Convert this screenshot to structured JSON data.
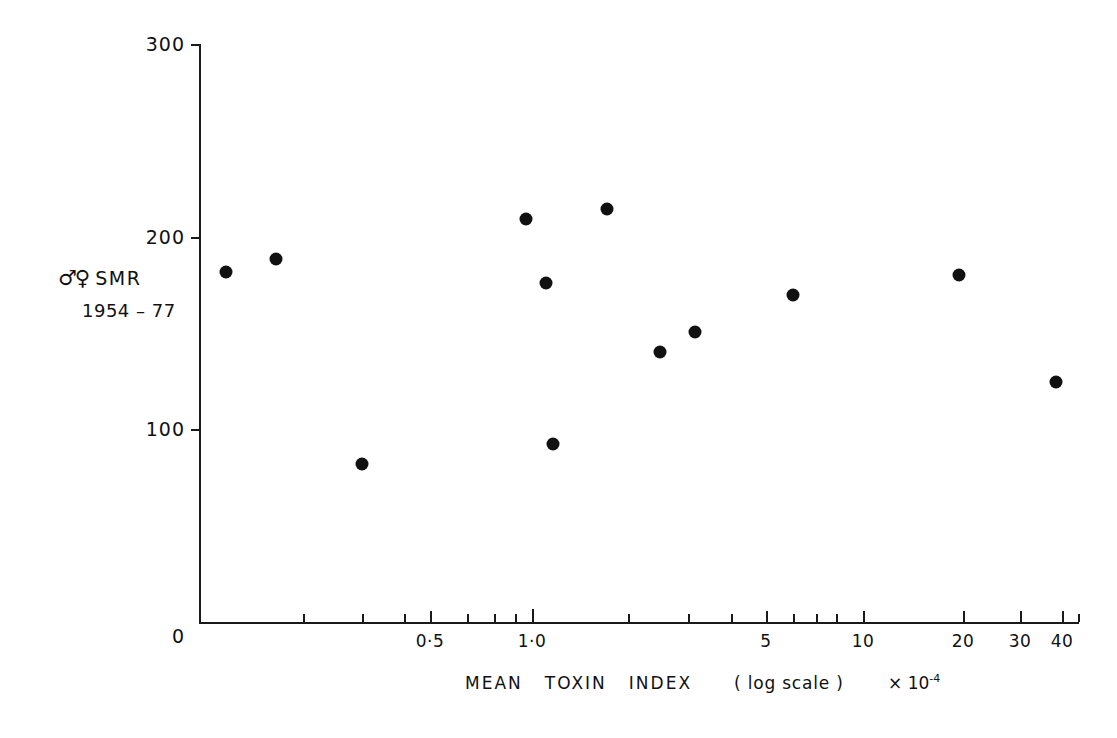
{
  "chart_data": {
    "type": "scatter",
    "title": "",
    "xlabel": "MEAN  TOXIN  INDEX   ( log  scale )",
    "xlabel_exponent": "× 10",
    "xlabel_exponent_sup": "-4",
    "ylabel_line1": "SMR",
    "ylabel_symbols": "♂♀",
    "ylabel_line2": "1954 – 77",
    "xscale": "log",
    "yscale": "linear",
    "xlim": [
      0.09,
      45
    ],
    "ylim": [
      0,
      300
    ],
    "grid": false,
    "legend": false,
    "ytick_labels": [
      "0",
      "100",
      "200",
      "300"
    ],
    "ytick_values": [
      0,
      100,
      200,
      300
    ],
    "xtick_labels": [
      "0·5",
      "1·0",
      "5",
      "10",
      "20",
      "30",
      "40"
    ],
    "xtick_values": [
      0.5,
      1.0,
      5,
      10,
      20,
      30,
      40
    ],
    "x_minor_ticks": [
      0.2,
      0.3,
      0.4,
      0.6,
      0.7,
      0.8,
      0.9,
      2,
      3,
      4,
      6,
      7,
      8,
      9
    ],
    "marker": "filled-circle",
    "marker_color": "#111111",
    "points": [
      {
        "x": 0.11,
        "y": 181,
        "px": 226,
        "py": 272
      },
      {
        "x": 0.16,
        "y": 188,
        "px": 276,
        "py": 259
      },
      {
        "x": 0.3,
        "y": 82,
        "px": 362,
        "py": 464
      },
      {
        "x": 0.97,
        "y": 209,
        "px": 526,
        "py": 219
      },
      {
        "x": 1.07,
        "y": 176,
        "px": 546,
        "py": 283
      },
      {
        "x": 1.11,
        "y": 92,
        "px": 553,
        "py": 444
      },
      {
        "x": 1.45,
        "y": 214,
        "px": 607,
        "py": 209
      },
      {
        "x": 1.97,
        "y": 140,
        "px": 660,
        "py": 352
      },
      {
        "x": 2.45,
        "y": 150,
        "px": 695,
        "py": 332
      },
      {
        "x": 6.0,
        "y": 170,
        "px": 793,
        "py": 295
      },
      {
        "x": 19.5,
        "y": 180,
        "px": 959,
        "py": 275
      },
      {
        "x": 38.0,
        "y": 125,
        "px": 1056,
        "py": 382
      }
    ]
  },
  "axis": {
    "y_ticks": [
      {
        "label": "300",
        "py": 44
      },
      {
        "label": "200",
        "py": 237
      },
      {
        "label": "100",
        "py": 429
      },
      {
        "label": "0",
        "py": 622
      }
    ],
    "x_ticks": [
      {
        "label": "0·5",
        "px": 430,
        "major": true
      },
      {
        "label": "1·0",
        "px": 532,
        "major": true
      },
      {
        "label": "5",
        "px": 766,
        "major": true
      },
      {
        "label": "10",
        "px": 863,
        "major": true
      },
      {
        "label": "20",
        "px": 963,
        "major": true
      },
      {
        "label": "30",
        "px": 1020,
        "major": true
      },
      {
        "label": "40",
        "px": 1062,
        "major": true
      }
    ],
    "x_minor_px": [
      303,
      362,
      404,
      467,
      494,
      514,
      532,
      628,
      688,
      731,
      766,
      793,
      816,
      836,
      1078
    ]
  },
  "labels": {
    "y_title_symbols": "♂♀",
    "y_title_text": "SMR",
    "y_title_years": "1954 – 77",
    "x_title_w1": "MEAN",
    "x_title_w2": "TOXIN",
    "x_title_w3": "INDEX",
    "x_title_logscale": "( log  scale )",
    "x_exp_base": "× 10",
    "x_exp_sup": "-4"
  }
}
